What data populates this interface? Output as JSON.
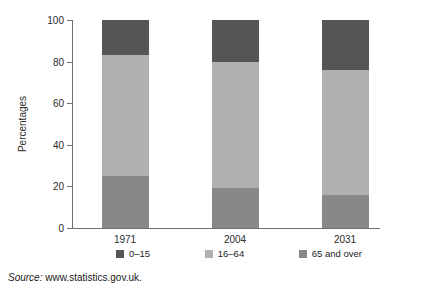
{
  "chart_data": {
    "type": "bar",
    "stacked": true,
    "title": "",
    "xlabel": "",
    "ylabel": "Percentages",
    "ylim": [
      0,
      100
    ],
    "yticks": [
      0,
      20,
      40,
      60,
      80,
      100
    ],
    "grid": false,
    "legend_position": "bottom",
    "categories": [
      "1971",
      "2004",
      "2031"
    ],
    "series": [
      {
        "name": "65 and over",
        "color": "#888888",
        "values": [
          25,
          19,
          16
        ]
      },
      {
        "name": "16–64",
        "color": "#b0b0b0",
        "values": [
          58,
          61,
          60
        ]
      },
      {
        "name": "0–15",
        "color": "#555555",
        "values": [
          17,
          20,
          24
        ]
      }
    ],
    "legend_order": [
      "0–15",
      "16–64",
      "65 and over"
    ]
  },
  "axis": {
    "y_title": "Percentages",
    "y_tick_labels": [
      "0",
      "20",
      "40",
      "60",
      "80",
      "100"
    ],
    "x_tick_labels": [
      "1971",
      "2004",
      "2031"
    ]
  },
  "legend": {
    "items": [
      {
        "label": "0–15",
        "color": "#555555"
      },
      {
        "label": "16–64",
        "color": "#b0b0b0"
      },
      {
        "label": "65 and over",
        "color": "#888888"
      }
    ]
  },
  "source": {
    "prefix": "Source:",
    "text": " www.statistics.gov.uk."
  },
  "colors": {
    "axis": "#6e6e6e",
    "text": "#1a1a1a",
    "background": "#ffffff",
    "age_0_15": "#555555",
    "age_16_64": "#b0b0b0",
    "age_65_plus": "#888888"
  }
}
